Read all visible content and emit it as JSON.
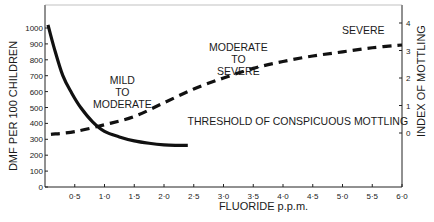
{
  "chart_data": {
    "type": "line",
    "title": "",
    "xlabel": "FLUORIDE p.p.m.",
    "ylabel": "DMF PER 100 CHILDREN",
    "y2label": "INDEX OF MOTTLING",
    "xlim": [
      0,
      6.0
    ],
    "ylim": [
      0,
      1000
    ],
    "y2lim": [
      0,
      4
    ],
    "grid": false,
    "legend": "none",
    "x_ticks": [
      "0·5",
      "1·0",
      "1·5",
      "2·0",
      "2·5",
      "3·0",
      "3·5",
      "4·0",
      "4·5",
      "5·0",
      "5·5",
      "6·0"
    ],
    "y_ticks": [
      "0",
      "100",
      "200",
      "300",
      "400",
      "500",
      "600",
      "700",
      "800",
      "900",
      "1000"
    ],
    "y2_ticks": [
      "0",
      "1",
      "2",
      "3",
      "4"
    ],
    "series": [
      {
        "name": "DMF per 100 children",
        "style": "solid",
        "axis": "left",
        "x": [
          0.05,
          0.15,
          0.3,
          0.45,
          0.6,
          0.8,
          1.0,
          1.25,
          1.5,
          1.75,
          2.0,
          2.2,
          2.4
        ],
        "y": [
          1020,
          880,
          700,
          590,
          500,
          410,
          350,
          315,
          290,
          275,
          265,
          262,
          262
        ]
      },
      {
        "name": "Index of mottling",
        "style": "dashed",
        "axis": "right",
        "x": [
          0.1,
          0.5,
          1.0,
          1.5,
          2.0,
          2.5,
          3.0,
          3.5,
          4.0,
          4.5,
          5.0,
          5.5,
          6.0
        ],
        "y": [
          -0.05,
          0.05,
          0.3,
          0.6,
          1.1,
          1.6,
          2.0,
          2.35,
          2.6,
          2.8,
          2.95,
          3.1,
          3.2
        ]
      }
    ],
    "annotations": [
      {
        "text": [
          "MILD",
          "TO",
          "MODERATE"
        ],
        "x": 1.3,
        "y2": 1.8
      },
      {
        "text": [
          "MODERATE",
          "TO",
          "SEVERE"
        ],
        "x": 3.25,
        "y2": 3.0
      },
      {
        "text": [
          "SEVERE"
        ],
        "x": 5.35,
        "y2": 3.6
      },
      {
        "text": [
          "THRESHOLD OF CONSPICUOUS MOTTLING"
        ],
        "x": 4.25,
        "y2": 0.28
      }
    ]
  }
}
